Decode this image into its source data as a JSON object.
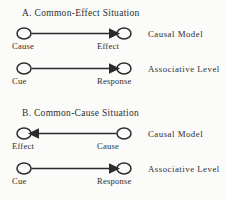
{
  "figure": {
    "background_color": "#fbfbf9",
    "ink_color": "#2b2b2b",
    "panels": [
      {
        "id": "A",
        "heading": "A. Common-Effect Situation",
        "rows": [
          {
            "id": "a-causal",
            "tier_label": "Causal Model",
            "arrow_direction": "right",
            "left_node_label": "Cause",
            "right_node_label": "Effect"
          },
          {
            "id": "a-associative",
            "tier_label": "Associative Level",
            "arrow_direction": "right",
            "left_node_label": "Cue",
            "right_node_label": "Response"
          }
        ]
      },
      {
        "id": "B",
        "heading": "B. Common-Cause Situation",
        "rows": [
          {
            "id": "b-causal",
            "tier_label": "Causal Model",
            "arrow_direction": "left",
            "left_node_label": "Effect",
            "right_node_label": "Cause"
          },
          {
            "id": "b-associative",
            "tier_label": "Associative Level",
            "arrow_direction": "right",
            "left_node_label": "Cue",
            "right_node_label": "Response"
          }
        ]
      }
    ]
  }
}
